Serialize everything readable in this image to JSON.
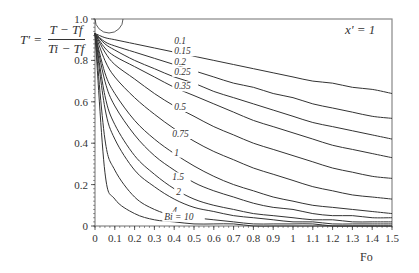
{
  "chart_data": {
    "type": "line",
    "title": "",
    "annotation": "x' = 1",
    "xlabel": "Fo",
    "ylabel": "T' = (T − T_f) / (T_i − T_f)",
    "ylabel_parts": {
      "lhs": "T' =",
      "num": "T − Tf",
      "den": "Ti − Tf"
    },
    "xlim": [
      0,
      1.5
    ],
    "ylim": [
      0,
      1.0
    ],
    "x_ticks": [
      "0",
      "0.1",
      "0.2",
      "0.3",
      "0.4",
      "0.5",
      "0.6",
      "0.7",
      "0.8",
      "0.9",
      "1",
      "1.1",
      "1.2",
      "1.3",
      "1.4",
      "1.5"
    ],
    "y_ticks": [
      "0",
      "0.2",
      "0.4",
      "0.6",
      "0.8",
      "1.0"
    ],
    "grid": false,
    "legend": "none (inline curve labels)",
    "series_param": "Bi",
    "x": [
      0.0,
      0.05,
      0.1,
      0.2,
      0.3,
      0.4,
      0.5,
      0.6,
      0.7,
      0.8,
      0.9,
      1.0,
      1.1,
      1.2,
      1.3,
      1.4,
      1.5
    ],
    "series": [
      {
        "name": "0.1",
        "values": [
          0.93,
          0.91,
          0.9,
          0.88,
          0.86,
          0.84,
          0.82,
          0.8,
          0.78,
          0.76,
          0.74,
          0.72,
          0.7,
          0.69,
          0.67,
          0.66,
          0.64
        ]
      },
      {
        "name": "0.15",
        "values": [
          0.93,
          0.89,
          0.87,
          0.84,
          0.81,
          0.78,
          0.75,
          0.72,
          0.69,
          0.67,
          0.64,
          0.62,
          0.59,
          0.57,
          0.55,
          0.53,
          0.52
        ]
      },
      {
        "name": "0.2",
        "values": [
          0.93,
          0.88,
          0.85,
          0.8,
          0.76,
          0.72,
          0.69,
          0.65,
          0.62,
          0.59,
          0.56,
          0.53,
          0.5,
          0.48,
          0.46,
          0.44,
          0.42
        ]
      },
      {
        "name": "0.25",
        "values": [
          0.93,
          0.86,
          0.82,
          0.77,
          0.72,
          0.67,
          0.63,
          0.59,
          0.55,
          0.51,
          0.48,
          0.45,
          0.42,
          0.39,
          0.37,
          0.35,
          0.33
        ]
      },
      {
        "name": "0.35",
        "values": [
          0.93,
          0.84,
          0.78,
          0.71,
          0.64,
          0.58,
          0.53,
          0.48,
          0.44,
          0.4,
          0.37,
          0.34,
          0.31,
          0.28,
          0.26,
          0.24,
          0.23
        ]
      },
      {
        "name": "0.5",
        "values": [
          0.93,
          0.8,
          0.72,
          0.62,
          0.54,
          0.47,
          0.41,
          0.36,
          0.32,
          0.28,
          0.25,
          0.22,
          0.19,
          0.17,
          0.15,
          0.14,
          0.13
        ]
      },
      {
        "name": "0.75",
        "values": [
          0.93,
          0.74,
          0.64,
          0.51,
          0.42,
          0.35,
          0.29,
          0.24,
          0.2,
          0.17,
          0.14,
          0.12,
          0.1,
          0.09,
          0.08,
          0.07,
          0.06
        ]
      },
      {
        "name": "1",
        "values": [
          0.93,
          0.7,
          0.58,
          0.44,
          0.34,
          0.27,
          0.21,
          0.17,
          0.14,
          0.11,
          0.09,
          0.08,
          0.06,
          0.05,
          0.05,
          0.04,
          0.04
        ]
      },
      {
        "name": "1.5",
        "values": [
          0.93,
          0.63,
          0.49,
          0.34,
          0.25,
          0.18,
          0.13,
          0.1,
          0.08,
          0.06,
          0.05,
          0.04,
          0.03,
          0.03,
          0.02,
          0.02,
          0.02
        ]
      },
      {
        "name": "2",
        "values": [
          0.93,
          0.57,
          0.42,
          0.27,
          0.19,
          0.13,
          0.09,
          0.07,
          0.05,
          0.04,
          0.03,
          0.02,
          0.02,
          0.01,
          0.01,
          0.01,
          0.01
        ]
      },
      {
        "name": "4",
        "values": [
          0.93,
          0.42,
          0.27,
          0.14,
          0.08,
          0.05,
          0.04,
          0.03,
          0.02,
          0.01,
          0.01,
          0.01,
          0.01,
          0.0,
          0.0,
          0.0,
          0.0
        ]
      },
      {
        "name": "10",
        "values": [
          0.93,
          0.26,
          0.13,
          0.06,
          0.03,
          0.02,
          0.01,
          0.01,
          0.01,
          0.0,
          0.0,
          0.0,
          0.0,
          0.0,
          0.0,
          0.0,
          0.0
        ]
      }
    ],
    "curve_labels": [
      {
        "text": "0.1",
        "x": 0.4,
        "y": 0.88
      },
      {
        "text": "0.15",
        "x": 0.4,
        "y": 0.83
      },
      {
        "text": "0.2",
        "x": 0.4,
        "y": 0.78
      },
      {
        "text": "0.25",
        "x": 0.4,
        "y": 0.73
      },
      {
        "text": "0.35",
        "x": 0.4,
        "y": 0.66
      },
      {
        "text": "0.5",
        "x": 0.4,
        "y": 0.56
      },
      {
        "text": "0.75",
        "x": 0.39,
        "y": 0.43
      },
      {
        "text": "1",
        "x": 0.4,
        "y": 0.34
      },
      {
        "text": "1.5",
        "x": 0.39,
        "y": 0.22
      },
      {
        "text": "2",
        "x": 0.41,
        "y": 0.15
      },
      {
        "text": "4",
        "x": 0.39,
        "y": 0.06
      },
      {
        "text": "Bi = 10",
        "x": 0.35,
        "y": 0.03
      }
    ],
    "bi_label": "Bi",
    "colors": {
      "line": "#333333",
      "frame": "#888888",
      "text": "#333333"
    }
  }
}
